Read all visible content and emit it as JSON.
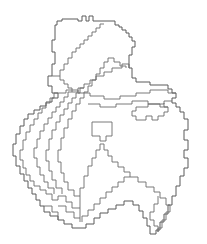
{
  "figure": {
    "kind": "administrative-boundary-map",
    "title": "",
    "width": 207,
    "height": 244,
    "background_color": "#ffffff",
    "outline_color": "#5a5a5a",
    "internal_boundary_color": "#6b6b6b",
    "fill_color": "#ffffff",
    "stroke_width": 1,
    "labels_visible": false,
    "legend_visible": false,
    "axes_visible": false,
    "rendering_style": "pixelated-raster-vectorized"
  },
  "map_data": {
    "type": "polygon-outline",
    "projection_note": "",
    "bounds": {
      "x_min": 13,
      "y_min": 14,
      "x_max": 196,
      "y_max": 234
    },
    "outer_outline": "M 55,30 L 55,25 L 57,25 L 57,21 L 62,21 L 62,19 L 78,19 L 78,21 L 82,21 L 82,16 L 86,16 L 86,21 L 89,21 L 89,16 L 93,16 L 93,21 L 115,21 L 115,25 L 119,25 L 119,27 L 122,27 L 122,30 L 126,30 L 126,33 L 129,33 L 129,37 L 132,37 L 132,41 L 135,41 L 135,47 L 132,47 L 132,55 L 129,55 L 129,68 L 132,68 L 132,78 L 136,78 L 136,82 L 150,82 L 150,85 L 168,85 L 168,89 L 172,89 L 172,93 L 176,93 L 176,98 L 172,98 L 172,103 L 176,103 L 176,107 L 180,107 L 180,112 L 184,112 L 184,119 L 188,119 L 188,130 L 184,130 L 184,140 L 188,140 L 188,150 L 184,150 L 184,158 L 188,158 L 188,168 L 184,168 L 184,176 L 180,176 L 180,186 L 176,186 L 176,196 L 172,196 L 172,205 L 168,205 L 168,214 L 164,214 L 164,222 L 160,222 L 160,230 L 156,230 L 156,234 L 150,234 L 150,226 L 147,226 L 147,218 L 143,218 L 143,211 L 139,211 L 139,205 L 133,205 L 133,201 L 124,201 L 124,205 L 116,205 L 116,209 L 108,209 L 108,213 L 100,213 L 100,218 L 94,218 L 94,224 L 86,224 L 86,228 L 72,228 L 72,224 L 64,224 L 64,220 L 58,220 L 58,216 L 50,216 L 50,212 L 44,212 L 44,206 L 40,206 L 40,200 L 36,200 L 36,194 L 32,194 L 32,188 L 28,188 L 28,181 L 24,181 L 24,174 L 20,174 L 20,166 L 16,166 L 16,156 L 13,156 L 13,144 L 16,144 L 16,134 L 20,134 L 20,126 L 24,126 L 24,119 L 28,119 L 28,114 L 34,114 L 34,110 L 40,110 L 40,106 L 46,106 L 46,102 L 52,102 L 52,98 L 58,98 L 58,93 L 52,93 L 52,86 L 48,86 L 48,76 L 52,76 L 52,64 L 55,64 L 55,52 L 52,52 L 52,40 L 55,40 Z",
    "internal_boundaries": [
      {
        "name": "northern-lobe-southern-limit",
        "path": "M 52,76 L 60,76 L 60,80 L 64,80 L 64,84 L 68,84 L 68,88 L 72,88 L 72,92 L 78,92 L 78,88 L 84,88 L 84,84 L 90,84 L 90,80 L 96,80 L 96,76 L 104,76 L 104,72 L 112,72 L 112,68 L 122,68 L 122,64 L 129,64 L 129,68"
      },
      {
        "name": "north-central-divide",
        "path": "M 60,76 L 60,70 L 64,70 L 64,64 L 68,64 L 68,58 L 72,58 L 72,52 L 76,52 L 76,48 L 80,48 L 80,44 L 84,44 L 84,40 L 88,40 L 88,36 L 92,36 L 92,32 L 96,32 L 96,28 L 100,28 L 100,24 L 104,24"
      },
      {
        "name": "northeast-lobe-divide",
        "path": "M 96,80 L 96,74 L 100,74 L 100,68 L 104,68 L 104,62 L 108,62 L 108,58 L 114,58 L 114,62 L 120,62 L 120,66 L 126,66 L 126,68"
      },
      {
        "name": "west-stripe-boundary-1",
        "path": "M 58,93 L 54,93 L 54,98 L 50,98 L 50,103 L 46,103 L 46,108 L 42,108 L 42,113 L 38,113 L 38,119 L 34,119 L 34,125 L 30,125 L 30,132 L 26,132 L 26,140 L 23,140 L 23,150 L 20,150 L 20,160 L 23,160 L 23,168 L 26,168 L 26,175 L 30,175 L 30,181 L 34,181 L 34,186 L 40,186 L 40,190 L 46,190 L 46,194 L 52,194"
      },
      {
        "name": "west-stripe-boundary-2",
        "path": "M 72,92 L 68,92 L 68,97 L 64,97 L 64,102 L 60,102 L 60,107 L 56,107 L 56,112 L 52,112 L 52,118 L 48,118 L 48,124 L 44,124 L 44,131 L 40,131 L 40,139 L 37,139 L 37,148 L 34,148 L 34,158 L 37,158 L 37,167 L 40,167 L 40,175 L 44,175 L 44,182 L 48,182 L 48,188 L 54,188 L 54,194"
      },
      {
        "name": "west-stripe-boundary-3",
        "path": "M 84,88 L 80,88 L 80,93 L 76,93 L 76,98 L 72,98 L 72,103 L 68,103 L 68,109 L 64,109 L 64,115 L 60,115 L 60,122 L 56,122 L 56,130 L 52,130 L 52,139 L 49,139 L 49,150 L 46,150 L 46,161 L 49,161 L 49,171 L 52,171 L 52,180 L 56,180 L 56,188 L 62,188 L 62,194"
      },
      {
        "name": "west-stripe-boundary-4",
        "path": "M 96,80 L 92,80 L 92,86 L 88,86 L 88,92 L 84,92 L 84,98 L 80,98 L 80,104 L 76,104 L 76,111 L 72,111 L 72,119 L 68,119 L 68,128 L 64,128 L 64,138 L 61,138 L 61,150 L 58,150 L 58,162 L 61,162 L 61,173 L 64,173 L 64,182 L 68,182 L 68,190 L 74,190 L 74,196 L 80,196"
      },
      {
        "name": "central-upper-horizontal",
        "path": "M 58,93 L 66,93 L 66,90 L 78,90 L 78,93 L 90,93 L 90,96 L 104,96 L 104,99 L 120,99 L 120,96 L 136,96 L 136,93 L 150,93 L 150,90 L 168,90 L 168,93 L 176,93"
      },
      {
        "name": "central-lower-horizontal",
        "path": "M 88,104 L 100,104 L 100,107 L 116,107 L 116,104 L 132,104 L 132,101 L 148,101 L 148,104 L 164,104 L 164,101 L 172,101"
      },
      {
        "name": "east-inner-block-boundary",
        "path": "M 136,107 L 136,111 L 132,111 L 132,116 L 136,116 L 136,120 L 146,120 L 146,116 L 152,116 L 152,120 L 158,120 L 158,116 L 164,116 L 164,112 L 168,112 L 168,107 L 164,107 L 164,103"
      },
      {
        "name": "east-inner-block-top",
        "path": "M 136,107 L 148,107 L 148,104 L 160,104 L 160,107 L 168,107"
      },
      {
        "name": "south-central-peninsula",
        "path": "M 96,158 L 96,150 L 100,150 L 100,144 L 104,144 L 104,150 L 108,150 L 108,156 L 112,156 L 112,162 L 118,162 L 118,167 L 124,167 L 124,172 L 130,172 L 130,177 L 124,177 L 124,182 L 118,182 L 118,187 L 112,187 L 112,192 L 106,192 L 106,198 L 100,198 L 100,204 L 94,204 L 94,210 L 88,210 L 88,216 L 82,216 L 82,222"
      },
      {
        "name": "south-central-west-edge",
        "path": "M 96,158 L 92,158 L 92,166 L 88,166 L 88,176 L 84,176 L 84,188 L 80,188 L 80,200 L 80,222"
      },
      {
        "name": "southeast-divide",
        "path": "M 130,177 L 138,177 L 138,182 L 146,182 L 146,187 L 154,187 L 154,192 L 160,192 L 160,198 L 166,198 L 166,205 L 170,205 L 170,212 L 166,212 L 166,220 L 162,220 L 162,228 L 158,228 L 158,232"
      },
      {
        "name": "southeast-tail-inner",
        "path": "M 158,196 L 158,204 L 154,204 L 154,212 L 150,212 L 150,220 L 154,220 L 154,226 L 158,226 L 158,232"
      },
      {
        "name": "south-lower-block-top",
        "path": "M 52,194 L 52,200 L 58,200 L 58,196 L 66,196 L 66,202 L 72,202 L 72,208 L 80,208"
      },
      {
        "name": "south-lower-block-divide",
        "path": "M 58,206 L 66,206 L 66,212 L 74,212 L 74,218 L 80,218"
      },
      {
        "name": "south-lower-left-edge",
        "path": "M 44,206 L 52,206 L 52,212 L 58,212 L 58,220"
      }
    ],
    "enclaves": [
      {
        "name": "central-enclave",
        "path": "M 92,122 L 112,122 L 112,136 L 106,136 L 106,141 L 100,141 L 100,136 L 92,136 Z"
      }
    ]
  },
  "accessibility": {
    "alt_text": "Outline map of an administrative region divided into internal districts, drawn as thin gray pixelated boundary lines on a white background."
  }
}
